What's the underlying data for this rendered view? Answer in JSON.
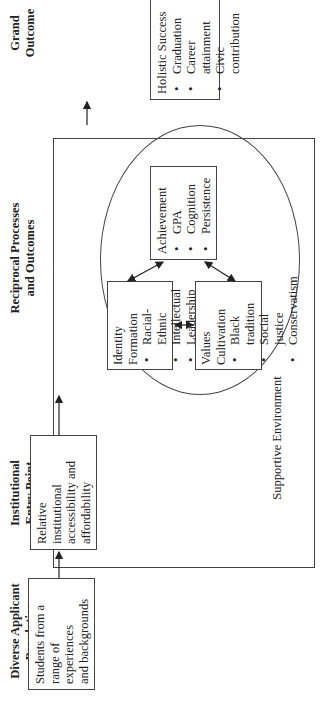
{
  "headers": {
    "col1": [
      "Diverse Applicant",
      "Population"
    ],
    "col2": [
      "Institutional",
      "Entry Point"
    ],
    "col3": [
      "Reciprocal Processes",
      "and Outcomes"
    ],
    "col4": [
      "Grand",
      "Outcome"
    ]
  },
  "boxes": {
    "students": {
      "lines": [
        "Students from a",
        "range of experiences",
        "and backgrounds"
      ]
    },
    "relative": {
      "lines": [
        "Relative institutional",
        "accessibility and",
        "affordability"
      ]
    },
    "identity": {
      "title": "Identity Formation",
      "items": [
        "Racial-Ethnic",
        "Intellectual",
        "Leadership"
      ]
    },
    "values": {
      "title": "Values Cultivation",
      "items": [
        "Black tradition",
        "Social justice",
        "Conservatism"
      ]
    },
    "achievement": {
      "title": "Achievement",
      "items": [
        "GPA",
        "Cognition",
        "Persistence"
      ]
    },
    "holistic": {
      "title": "Holistic Success",
      "items": [
        "Graduation",
        "Career attainment",
        "Civic contribution"
      ]
    }
  },
  "environment_label": "Supportive Environment",
  "orientation": "rotated 90 degrees counter-clockwise"
}
